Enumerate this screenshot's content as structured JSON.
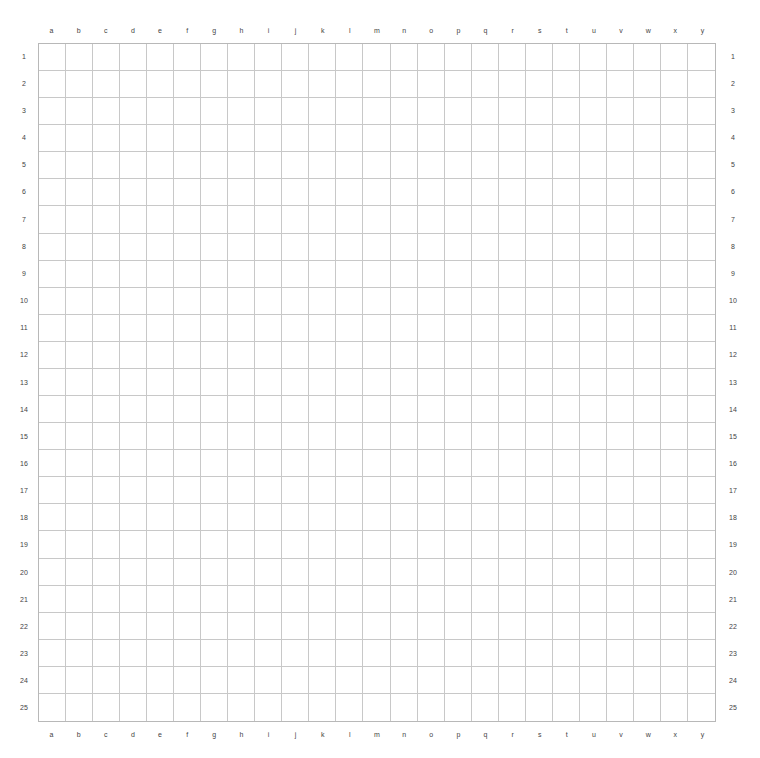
{
  "board": {
    "size": 25,
    "columns": [
      "a",
      "b",
      "c",
      "d",
      "e",
      "f",
      "g",
      "h",
      "i",
      "j",
      "k",
      "l",
      "m",
      "n",
      "o",
      "p",
      "q",
      "r",
      "s",
      "t",
      "u",
      "v",
      "w",
      "x",
      "y"
    ],
    "rows": [
      "1",
      "2",
      "3",
      "4",
      "5",
      "6",
      "7",
      "8",
      "9",
      "10",
      "11",
      "12",
      "13",
      "14",
      "15",
      "16",
      "17",
      "18",
      "19",
      "20",
      "21",
      "22",
      "23",
      "24",
      "25"
    ],
    "stones": [],
    "colors": {
      "background": "#ffffff",
      "grid_line": "#c8c8c8",
      "label": "#444444"
    }
  }
}
